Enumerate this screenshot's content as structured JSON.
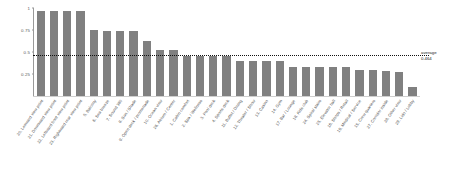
{
  "chart_data": {
    "type": "bar",
    "title": "",
    "subtitle": "",
    "xlabel": "",
    "ylabel": "",
    "ylim": [
      0,
      1.0
    ],
    "grid": false,
    "legend": null,
    "bar_color": "#808080",
    "categories": [
      "20. Leeward view point",
      "21. Downward view point",
      "22. Leftward front view point",
      "23. Rightward rear view point",
      "5. Balcony",
      "6. Sea breeze",
      "7. Sound 360",
      "8. Sun / Shade",
      "9. Open deck / promenade",
      "10. Ocean view",
      "26. Atrium / Center",
      "1. Cabin comfort",
      "2. Spa / Wellness",
      "3. Pool deck",
      "4. Sports deck",
      "11. Buffet / Dining",
      "12. Theater / Show",
      "13. Casino",
      "14. Gym",
      "17. Bar / Lounge",
      "18. Kids club",
      "24. Spiral stairs",
      "25. Elevator hall",
      "16. Shops / Retail",
      "19. Medical / Service",
      "15. Crew quarters",
      "27. Corridor inside",
      "28. Other view",
      "29. Lido / Lobby"
    ],
    "values": [
      0.97,
      0.97,
      0.97,
      0.97,
      0.75,
      0.74,
      0.74,
      0.74,
      0.62,
      0.52,
      0.52,
      0.45,
      0.45,
      0.45,
      0.45,
      0.4,
      0.4,
      0.4,
      0.4,
      0.33,
      0.33,
      0.33,
      0.33,
      0.33,
      0.3,
      0.3,
      0.28,
      0.27,
      0.1
    ],
    "yticks": [
      "1",
      "0.75",
      "0.5",
      "0.25"
    ],
    "ytick_values": [
      1.0,
      0.75,
      0.5,
      0.25
    ],
    "annotations": [
      {
        "name": "average-line",
        "label_line1": "average",
        "label_line2": "0.464",
        "value": 0.464,
        "style": "dotted"
      }
    ]
  }
}
